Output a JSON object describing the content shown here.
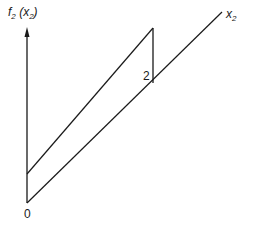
{
  "diagram": {
    "y_axis_label": {
      "fn": "f",
      "sub": "2",
      "arg": "x",
      "arg_sub": "2"
    },
    "x_axis_label": {
      "var": "x",
      "sub": "2"
    },
    "origin_label": "0",
    "jump_label": "2",
    "colors": {
      "line": "#1a1a1a",
      "background": "#ffffff"
    }
  }
}
